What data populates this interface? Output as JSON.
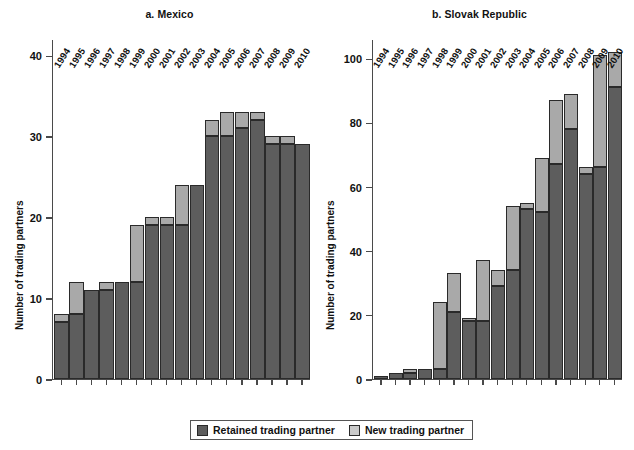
{
  "legend": {
    "retained_label": "Retained trading partner",
    "new_label": "New trading partner",
    "retained_color": "#5d5d5d",
    "new_color": "#a9a9a9",
    "position": "bottom-center"
  },
  "axis_title": "Number of trading partners",
  "chart_data": [
    {
      "type": "bar",
      "title": "a. Mexico",
      "xlabel": "",
      "ylabel": "Number of trading partners",
      "ylim": [
        0,
        42
      ],
      "yticks": [
        0,
        10,
        20,
        30,
        40
      ],
      "ytick_labels": [
        "0",
        "10",
        "20",
        "30",
        "40"
      ],
      "grid": false,
      "stacked": true,
      "categories": [
        "1994",
        "1995",
        "1996",
        "1997",
        "1998",
        "1999",
        "2000",
        "2001",
        "2002",
        "2003",
        "2004",
        "2005",
        "2006",
        "2007",
        "2008",
        "2009",
        "2010"
      ],
      "series": [
        {
          "name": "Retained trading partner",
          "values": [
            7,
            8,
            11,
            11,
            12,
            12,
            19,
            19,
            19,
            24,
            30,
            30,
            31,
            32,
            29,
            29,
            29
          ]
        },
        {
          "name": "New trading partner",
          "values": [
            1,
            4,
            0,
            1,
            0,
            7,
            1,
            1,
            5,
            0,
            2,
            3,
            2,
            1,
            1,
            1,
            0
          ]
        }
      ],
      "totals": [
        8,
        12,
        11,
        12,
        12,
        19,
        20,
        20,
        24,
        24,
        32,
        33,
        33,
        33,
        30,
        30,
        29
      ]
    },
    {
      "type": "bar",
      "title": "b. Slovak Republic",
      "xlabel": "",
      "ylabel": "Number of trading partners",
      "ylim": [
        0,
        106
      ],
      "yticks": [
        0,
        20,
        40,
        60,
        80,
        100
      ],
      "ytick_labels": [
        "0",
        "20",
        "40",
        "60",
        "80",
        "100"
      ],
      "grid": false,
      "stacked": true,
      "categories": [
        "1994",
        "1995",
        "1996",
        "1997",
        "1998",
        "1999",
        "2000",
        "2001",
        "2002",
        "2003",
        "2004",
        "2005",
        "2006",
        "2007",
        "2008",
        "2009",
        "2010"
      ],
      "series": [
        {
          "name": "Retained trading partner",
          "values": [
            1,
            2,
            2,
            3,
            3,
            21,
            18,
            18,
            29,
            34,
            53,
            52,
            67,
            78,
            64,
            66,
            91
          ]
        },
        {
          "name": "New trading partner",
          "values": [
            0,
            0,
            1,
            0,
            21,
            12,
            1,
            19,
            5,
            20,
            2,
            17,
            20,
            11,
            2,
            35,
            11
          ]
        }
      ],
      "totals": [
        1,
        2,
        3,
        3,
        24,
        33,
        19,
        37,
        34,
        54,
        55,
        69,
        87,
        89,
        66,
        101,
        102
      ]
    }
  ]
}
